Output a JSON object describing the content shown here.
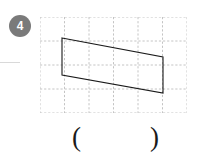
{
  "question": {
    "number_label": "4",
    "badge_color": "#7a7a7a",
    "badge_text_color": "#ffffff"
  },
  "answer_field": {
    "open_paren": "(",
    "close_paren": ")",
    "value": ""
  },
  "figure": {
    "stroke_color": "#1a1a1a",
    "grid_color": "#bdbdbd",
    "grid": {
      "columns": 6,
      "rows": 4,
      "cell_width": 24.5,
      "cell_height": 24,
      "dashed": true,
      "width": 147,
      "height": 96
    },
    "shape": {
      "type": "parallelogram",
      "vertices": [
        {
          "x": 22,
          "y": 21
        },
        {
          "x": 123,
          "y": 40
        },
        {
          "x": 123,
          "y": 76
        },
        {
          "x": 22,
          "y": 58
        }
      ],
      "closed": true,
      "fill": "none",
      "stroke_width": 1.1
    }
  }
}
